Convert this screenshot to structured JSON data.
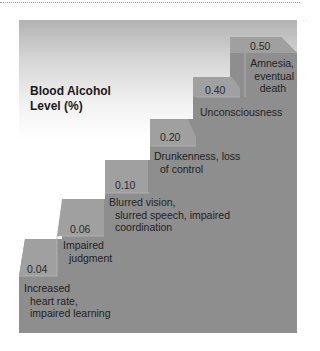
{
  "title": {
    "line1": "Blood Alcohol",
    "line2": "Level (%)"
  },
  "colors": {
    "panel_top": "#b2b2b2",
    "step_body": "#8e8e8e",
    "step_face": "#a0a0a0",
    "text": "#222222"
  },
  "steps": [
    {
      "level": "0.04",
      "description": [
        "Increased",
        "heart rate,",
        "impaired learning"
      ]
    },
    {
      "level": "0.06",
      "description": [
        "Impaired",
        "judgment"
      ]
    },
    {
      "level": "0.10",
      "description": [
        "Blurred vision,",
        "slurred speech, impaired",
        "coordination"
      ]
    },
    {
      "level": "0.20",
      "description": [
        "Drunkenness, loss",
        "of control"
      ]
    },
    {
      "level": "0.40",
      "description": [
        "Unconsciousness"
      ]
    },
    {
      "level": "0.50",
      "description": [
        "Amnesia,",
        "eventual",
        "death"
      ]
    }
  ]
}
